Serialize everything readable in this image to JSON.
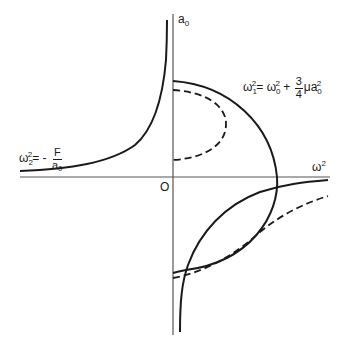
{
  "diagram": {
    "axes": {
      "x_label": "ω",
      "x_label_sup": "2",
      "y_label": "a",
      "y_label_sub": "0",
      "origin_label": "O"
    },
    "equations": {
      "omega1": {
        "lhs": "ω",
        "lhs_sub": "1",
        "lhs_sup": "2",
        "eq": "=",
        "term1": "ω",
        "term1_sub": "0",
        "term1_sup": "2",
        "plus": "+",
        "frac_num": "3",
        "frac_den": "4",
        "mu": "μ",
        "term2": "a",
        "term2_sub": "0",
        "term2_sup": "2"
      },
      "omega2": {
        "lhs": "ω",
        "lhs_sub": "2",
        "lhs_sup": "2",
        "eq": "= -",
        "frac_num": "F",
        "frac_den": "a",
        "frac_den_sub": "0"
      }
    },
    "colors": {
      "stroke": "#1a1a1a",
      "axis": "#555555",
      "background": "#ffffff"
    }
  }
}
